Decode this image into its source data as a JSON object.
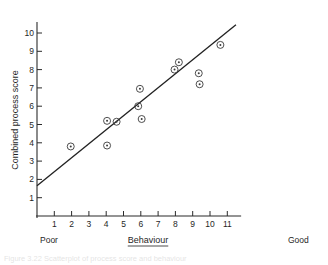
{
  "figure": {
    "caption": "Figure 3.22 Scatterplot of process score and behaviour",
    "caption_visible": false
  },
  "chart_data": {
    "type": "scatter",
    "title": "",
    "subtitle": "",
    "xlabel": "Behaviour",
    "ylabel": "Combined process score",
    "xlim": [
      0,
      11.8
    ],
    "ylim": [
      0,
      10.6
    ],
    "grid": false,
    "legend": "none",
    "x_ticks": [
      1,
      2,
      3,
      4,
      5,
      6,
      7,
      8,
      9,
      10,
      11
    ],
    "x_tick_labels": [
      "1",
      "2",
      "3",
      "4",
      "5",
      "6",
      "7",
      "8",
      "9",
      "10",
      "11"
    ],
    "y_ticks": [
      1,
      2,
      3,
      4,
      5,
      6,
      7,
      8,
      9,
      10
    ],
    "y_tick_labels": [
      "1",
      "2",
      "3",
      "4",
      "5",
      "6",
      "7",
      "8",
      "9",
      "10"
    ],
    "x_axis_anchor_low": "Poor",
    "x_axis_anchor_high": "Good",
    "marker_style": "circle-with-center-dot",
    "points": [
      {
        "x": 1.95,
        "y": 3.8
      },
      {
        "x": 4.05,
        "y": 3.85
      },
      {
        "x": 4.05,
        "y": 5.2
      },
      {
        "x": 4.6,
        "y": 5.15
      },
      {
        "x": 5.85,
        "y": 6.0
      },
      {
        "x": 5.95,
        "y": 6.95
      },
      {
        "x": 6.05,
        "y": 5.3
      },
      {
        "x": 7.95,
        "y": 8.0
      },
      {
        "x": 8.2,
        "y": 8.4
      },
      {
        "x": 9.35,
        "y": 7.8
      },
      {
        "x": 9.4,
        "y": 7.2
      },
      {
        "x": 10.6,
        "y": 9.35
      }
    ],
    "fit_line": {
      "label": "regression line",
      "x_start": 0.0,
      "y_start": 1.65,
      "x_end": 11.5,
      "y_end": 10.45
    }
  },
  "colors": {
    "axis": "#2b2b2b",
    "marker": "#3a3a3a",
    "fit_line": "#222222",
    "background": "#ffffff",
    "caption": "#6a6a6a"
  }
}
